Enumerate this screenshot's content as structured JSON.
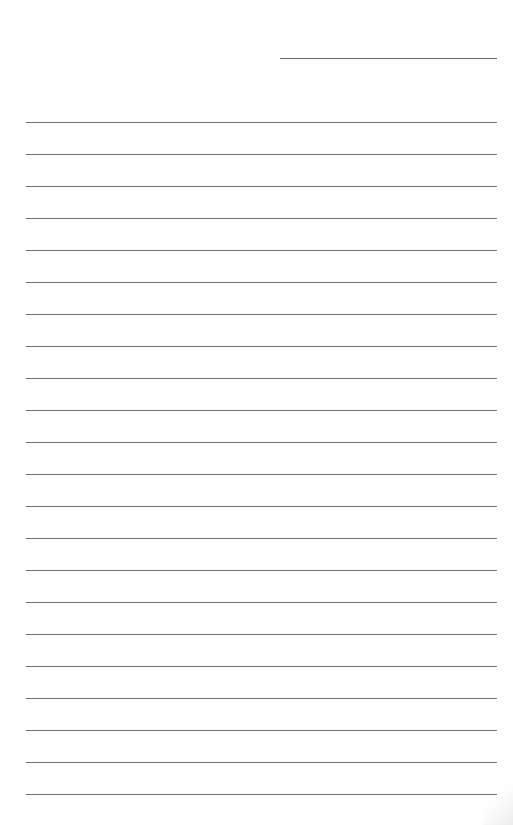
{
  "page": {
    "type": "lined-paper",
    "background": "#fefefe",
    "line_color": "#707070",
    "header_line": {
      "x1": 280,
      "x2": 497,
      "y": 58
    },
    "rules": {
      "x1": 26,
      "x2": 497,
      "first_y": 122,
      "spacing": 32,
      "count": 22
    }
  }
}
